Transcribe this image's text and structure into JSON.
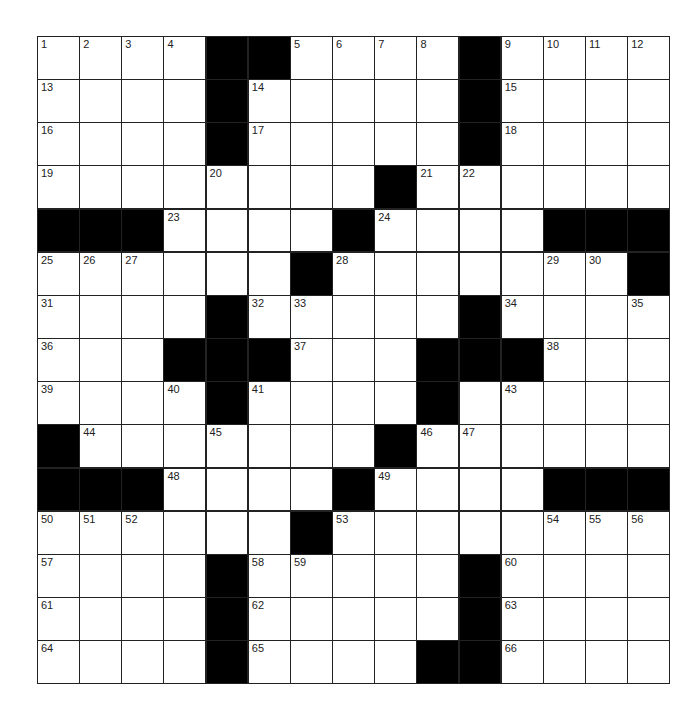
{
  "puzzle": {
    "rows": 15,
    "cols": 15,
    "colors": {
      "block": "#000000",
      "cell": "#ffffff",
      "line": "#222222"
    },
    "grid": [
      "....##....#....",
      "....#.....#....",
      "....#.....#....",
      "........#......",
      "###....#....###",
      "......#.......#",
      "....#.....#....",
      "...###...###...",
      "....#....#.....",
      "#.......#......",
      "###....#....###",
      "......#........",
      "....#.....#....",
      "....#.....#....",
      "....#....##...."
    ],
    "numbers": [
      {
        "r": 0,
        "c": 0,
        "n": "1"
      },
      {
        "r": 0,
        "c": 1,
        "n": "2"
      },
      {
        "r": 0,
        "c": 2,
        "n": "3"
      },
      {
        "r": 0,
        "c": 3,
        "n": "4"
      },
      {
        "r": 0,
        "c": 6,
        "n": "5"
      },
      {
        "r": 0,
        "c": 7,
        "n": "6"
      },
      {
        "r": 0,
        "c": 8,
        "n": "7"
      },
      {
        "r": 0,
        "c": 9,
        "n": "8"
      },
      {
        "r": 0,
        "c": 11,
        "n": "9"
      },
      {
        "r": 0,
        "c": 12,
        "n": "10"
      },
      {
        "r": 0,
        "c": 13,
        "n": "11"
      },
      {
        "r": 0,
        "c": 14,
        "n": "12"
      },
      {
        "r": 1,
        "c": 0,
        "n": "13"
      },
      {
        "r": 1,
        "c": 5,
        "n": "14"
      },
      {
        "r": 1,
        "c": 11,
        "n": "15"
      },
      {
        "r": 2,
        "c": 0,
        "n": "16"
      },
      {
        "r": 2,
        "c": 5,
        "n": "17"
      },
      {
        "r": 2,
        "c": 11,
        "n": "18"
      },
      {
        "r": 3,
        "c": 0,
        "n": "19"
      },
      {
        "r": 3,
        "c": 4,
        "n": "20"
      },
      {
        "r": 3,
        "c": 9,
        "n": "21"
      },
      {
        "r": 3,
        "c": 10,
        "n": "22"
      },
      {
        "r": 4,
        "c": 3,
        "n": "23"
      },
      {
        "r": 4,
        "c": 8,
        "n": "24"
      },
      {
        "r": 5,
        "c": 0,
        "n": "25"
      },
      {
        "r": 5,
        "c": 1,
        "n": "26"
      },
      {
        "r": 5,
        "c": 2,
        "n": "27"
      },
      {
        "r": 5,
        "c": 7,
        "n": "28"
      },
      {
        "r": 5,
        "c": 12,
        "n": "29"
      },
      {
        "r": 5,
        "c": 13,
        "n": "30"
      },
      {
        "r": 6,
        "c": 0,
        "n": "31"
      },
      {
        "r": 6,
        "c": 5,
        "n": "32"
      },
      {
        "r": 6,
        "c": 6,
        "n": "33"
      },
      {
        "r": 6,
        "c": 11,
        "n": "34"
      },
      {
        "r": 6,
        "c": 14,
        "n": "35"
      },
      {
        "r": 7,
        "c": 0,
        "n": "36"
      },
      {
        "r": 7,
        "c": 6,
        "n": "37"
      },
      {
        "r": 7,
        "c": 12,
        "n": "38"
      },
      {
        "r": 8,
        "c": 0,
        "n": "39"
      },
      {
        "r": 8,
        "c": 3,
        "n": "40"
      },
      {
        "r": 8,
        "c": 5,
        "n": "41"
      },
      {
        "r": 8,
        "c": 9,
        "n": "42"
      },
      {
        "r": 8,
        "c": 11,
        "n": "43"
      },
      {
        "r": 9,
        "c": 1,
        "n": "44"
      },
      {
        "r": 9,
        "c": 4,
        "n": "45"
      },
      {
        "r": 9,
        "c": 9,
        "n": "46"
      },
      {
        "r": 9,
        "c": 10,
        "n": "47"
      },
      {
        "r": 10,
        "c": 3,
        "n": "48"
      },
      {
        "r": 10,
        "c": 8,
        "n": "49"
      },
      {
        "r": 11,
        "c": 0,
        "n": "50"
      },
      {
        "r": 11,
        "c": 1,
        "n": "51"
      },
      {
        "r": 11,
        "c": 2,
        "n": "52"
      },
      {
        "r": 11,
        "c": 7,
        "n": "53"
      },
      {
        "r": 11,
        "c": 12,
        "n": "54"
      },
      {
        "r": 11,
        "c": 13,
        "n": "55"
      },
      {
        "r": 11,
        "c": 14,
        "n": "56"
      },
      {
        "r": 12,
        "c": 0,
        "n": "57"
      },
      {
        "r": 12,
        "c": 5,
        "n": "58"
      },
      {
        "r": 12,
        "c": 6,
        "n": "59"
      },
      {
        "r": 12,
        "c": 11,
        "n": "60"
      },
      {
        "r": 13,
        "c": 0,
        "n": "61"
      },
      {
        "r": 13,
        "c": 5,
        "n": "62"
      },
      {
        "r": 13,
        "c": 11,
        "n": "63"
      },
      {
        "r": 14,
        "c": 0,
        "n": "64"
      },
      {
        "r": 14,
        "c": 5,
        "n": "65"
      },
      {
        "r": 14,
        "c": 11,
        "n": "66"
      }
    ]
  }
}
